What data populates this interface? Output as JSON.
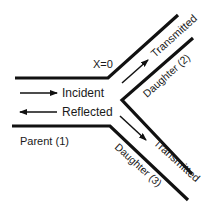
{
  "diagram": {
    "labels": {
      "junction": "X=0",
      "incident": "Incident",
      "reflected": "Reflected",
      "transmitted_upper": "Transmitted",
      "transmitted_lower": "Transmitted",
      "parent": "Parent (1)",
      "daughter_upper": "Daughter (2)",
      "daughter_lower": "Daughter (3)"
    },
    "colors": {
      "line": "#111111",
      "text": "#1a1a1a",
      "background": "#ffffff"
    }
  }
}
